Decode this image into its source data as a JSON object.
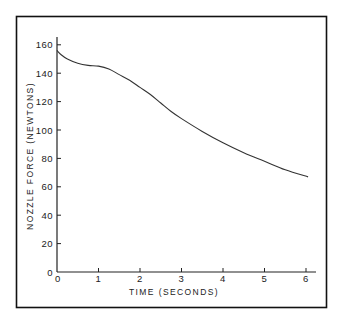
{
  "chart_data": {
    "type": "line",
    "title": "",
    "xlabel": "TIME (SECONDS)",
    "ylabel": "NOZZLE FORCE (NEWTONS)",
    "xlim": [
      0,
      6.2
    ],
    "ylim": [
      0,
      165
    ],
    "x_ticks": [
      0,
      1,
      2,
      3,
      4,
      5,
      6
    ],
    "x_tick_labels": [
      "0",
      "1",
      "2",
      "3",
      "4",
      "5",
      "6"
    ],
    "y_ticks": [
      0,
      20,
      40,
      60,
      80,
      100,
      120,
      140,
      160
    ],
    "y_tick_labels": [
      "0",
      "20",
      "40",
      "60",
      "80",
      "100",
      "120",
      "140",
      "160"
    ],
    "grid": false,
    "legend": null,
    "series": [
      {
        "name": "Nozzle force",
        "x": [
          0,
          0.1,
          0.25,
          0.5,
          0.75,
          1.0,
          1.25,
          1.5,
          1.75,
          2.0,
          2.25,
          2.5,
          2.75,
          3.0,
          3.5,
          4.0,
          4.5,
          5.0,
          5.5,
          6.05
        ],
        "values": [
          156,
          153,
          150,
          147,
          145.5,
          145,
          143,
          139,
          135,
          130,
          125,
          119,
          113,
          108,
          99,
          91,
          84,
          78,
          72,
          67
        ]
      }
    ]
  }
}
